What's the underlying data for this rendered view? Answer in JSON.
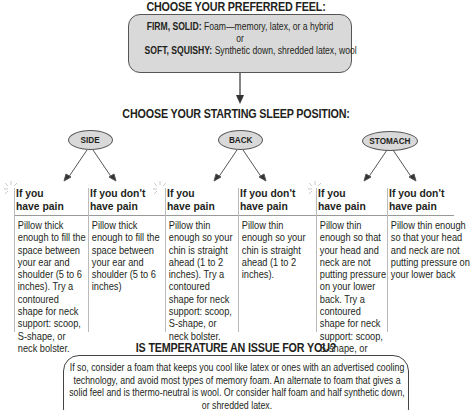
{
  "feel": {
    "heading": "CHOOSE YOUR PREFERRED FEEL:",
    "firm_label": "FIRM, SOLID:",
    "firm_text": " Foam—memory, latex, or a hybrid",
    "or": "or",
    "soft_label": "SOFT, SQUISHY:",
    "soft_text": " Synthetic down, shredded latex, wool"
  },
  "position": {
    "heading": "CHOOSE YOUR STARTING SLEEP POSITION:",
    "positions": [
      {
        "label": "SIDE",
        "pain_heading": "If you have pain",
        "pain_text": "Pillow thick enough to fill the space between your ear and shoulder (5 to 6 inches). Try a contoured shape for neck support: scoop, S-shape, or neck bolster.",
        "no_pain_heading": "If you don't have pain",
        "no_pain_text": "Pillow thick enough to fill the space between your ear and shoulder (5 to 6 inches)"
      },
      {
        "label": "BACK",
        "pain_heading": "If you have pain",
        "pain_text": "Pillow thin enough so your chin is straight ahead (1 to 2 inches). Try a contoured shape for neck support: scoop, S-shape, or neck bolster.",
        "no_pain_heading": "If you don't have pain",
        "no_pain_text": "Pillow thin enough so your chin is straight ahead (1 to 2 inches)."
      },
      {
        "label": "STOMACH",
        "pain_heading": "If you have pain",
        "pain_text": "Pillow thin enough so that your head and neck are not putting pressure on your lower back. Try a contoured shape for neck support: scoop, S-shape, or neck bolster.",
        "no_pain_heading": "If you don't have pain",
        "no_pain_text": "Pillow thin enough so that your head and neck are not putting pressure on your lower back"
      }
    ]
  },
  "temperature": {
    "heading": "IS TEMPERATURE AN ISSUE FOR YOU?",
    "text": "If so, consider a foam that keeps you cool like latex or ones with an advertised cooling technology, and avoid most types of memory foam. An alternate to foam that gives a solid feel and is thermo-neutral is wool. Or consider half foam and half synthetic down, or shredded latex."
  },
  "colors": {
    "box_fill": "#d9d9d9",
    "outline": "#555555",
    "text": "#231f20"
  }
}
